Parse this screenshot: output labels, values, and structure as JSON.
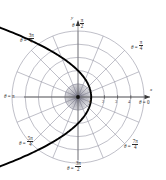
{
  "figure": {
    "type": "polar-plot",
    "axis_x_name": "x",
    "axis_y_name": "y",
    "pole": {
      "x": 78,
      "y": 97
    },
    "unit_px": 13.2,
    "grid_rings": 5,
    "grid_spokes": 16,
    "colors": {
      "curve": "#000000",
      "grid": "#8a8a9a",
      "axis": "#6b6b6b",
      "text": "#2b2b2b",
      "background": "#ffffff"
    }
  },
  "angle_labels": [
    {
      "name": "theta-0",
      "eq": "θ = ",
      "value": "0",
      "frac": null,
      "x": 139,
      "y": 100
    },
    {
      "name": "theta-pi-4",
      "eq": "θ = ",
      "value": null,
      "frac": {
        "num": "π",
        "den": "4"
      },
      "x": 131,
      "y": 40
    },
    {
      "name": "theta-pi-2",
      "eq": "θ = ",
      "value": null,
      "frac": {
        "num": "π",
        "den": "2"
      },
      "x": 72,
      "y": 18
    },
    {
      "name": "theta-3pi-4",
      "eq": "θ = ",
      "value": null,
      "frac": {
        "num": "3π",
        "den": "4"
      },
      "x": 20,
      "y": 33
    },
    {
      "name": "theta-pi",
      "eq": "θ = ",
      "value": "π",
      "frac": null,
      "x": 4,
      "y": 94
    },
    {
      "name": "theta-5pi-4",
      "eq": "θ = ",
      "value": null,
      "frac": {
        "num": "5π",
        "den": "4"
      },
      "x": 19,
      "y": 136
    },
    {
      "name": "theta-3pi-2",
      "eq": "θ = ",
      "value": null,
      "frac": {
        "num": "3π",
        "den": "2"
      },
      "x": 67,
      "y": 161
    },
    {
      "name": "theta-7pi-4",
      "eq": "θ = ",
      "value": null,
      "frac": {
        "num": "7π",
        "den": "4"
      },
      "x": 124,
      "y": 139
    }
  ],
  "radial_ticks": [
    {
      "label": "1",
      "r": 1,
      "x": 89,
      "y": 100
    },
    {
      "label": "2",
      "r": 2,
      "x": 102,
      "y": 100
    },
    {
      "label": "3",
      "r": 3,
      "x": 115,
      "y": 100
    },
    {
      "label": "4",
      "r": 4,
      "x": 128,
      "y": 100
    }
  ],
  "chart_data": {
    "type": "line",
    "title": "",
    "xlabel": "x",
    "ylabel": "y",
    "coordinate_system": "polar",
    "curve_name": "leftward-opening parabola",
    "equation": "r = 2 / (1 + cos θ)",
    "directrix_distance": 2,
    "eccentricity": 1,
    "vertex_polar": {
      "r": 1,
      "theta": 0
    },
    "opens_toward": "theta = pi",
    "arrowheads": [
      "upper-right end",
      "lower-right end"
    ],
    "theta_ticks_deg": [
      0,
      45,
      90,
      135,
      180,
      225,
      270,
      315
    ],
    "theta_tick_labels": [
      "0",
      "π/4",
      "π/2",
      "3π/4",
      "π",
      "5π/4",
      "3π/2",
      "7π/4"
    ],
    "r_ticks": [
      1,
      2,
      3,
      4
    ],
    "rlim": [
      0,
      5
    ],
    "grid": true,
    "legend": "none"
  }
}
